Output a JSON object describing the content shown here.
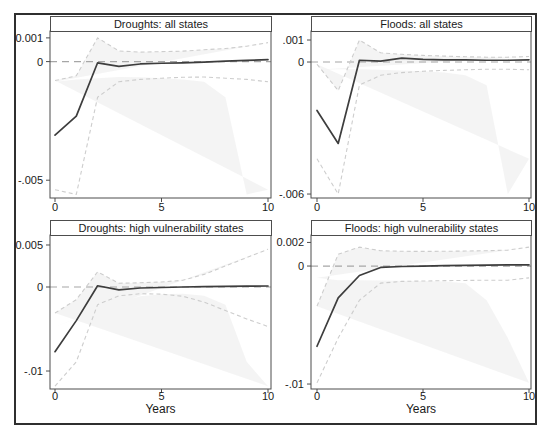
{
  "figure": {
    "background": "#ffffff",
    "border_color": "#2f2f2f"
  },
  "colors": {
    "main_line": "#3d3d3d",
    "ci_line": "#cdcdcd",
    "ci_fill": "rgba(205,205,205,0.22)",
    "zero_line": "#a6a6a6",
    "axis": "#4d4d4d",
    "text": "#1a1a1a"
  },
  "chart_data": [
    {
      "type": "line",
      "title": "Droughts: all states",
      "xlabel": "",
      "x": [
        0,
        1,
        2,
        3,
        4,
        5,
        6,
        7,
        8,
        9,
        10
      ],
      "xlim": [
        0,
        10
      ],
      "ylim": [
        -0.00575,
        0.00129
      ],
      "xticks": {
        "values": [
          0,
          5,
          10
        ],
        "labels": [
          "0",
          "5",
          "10"
        ]
      },
      "yticks": {
        "values": [
          0.001,
          0,
          -0.005
        ],
        "labels": [
          "0.001",
          "0",
          "-.005"
        ]
      },
      "zero_line": true,
      "grid": false,
      "legend": "none",
      "series": [
        {
          "name": "point-estimate",
          "values": [
            -0.0031,
            -0.0023,
            -5e-05,
            -0.0002,
            -0.0001,
            -7e-05,
            -5e-05,
            -2e-05,
            2e-05,
            5e-05,
            8e-05
          ]
        },
        {
          "name": "ci-upper",
          "values": [
            -0.0008,
            -0.0006,
            0.001,
            0.00045,
            0.0004,
            0.00042,
            0.00044,
            0.0005,
            0.00055,
            0.00065,
            0.0008
          ]
        },
        {
          "name": "ci-lower",
          "values": [
            -0.0054,
            -0.0056,
            -0.0015,
            -0.00085,
            -0.00075,
            -0.0007,
            -0.00066,
            -0.00065,
            -0.0007,
            -0.00075,
            -0.00085
          ]
        }
      ]
    },
    {
      "type": "line",
      "title": "Floods: all states",
      "xlabel": "",
      "x": [
        0,
        1,
        2,
        3,
        4,
        5,
        6,
        7,
        8,
        9,
        10
      ],
      "xlim": [
        0,
        10
      ],
      "ylim": [
        -0.00618,
        0.00141
      ],
      "xticks": {
        "values": [
          0,
          5,
          10
        ],
        "labels": [
          "0",
          "5",
          "10"
        ]
      },
      "yticks": {
        "values": [
          0.001,
          0,
          -0.006
        ],
        "labels": [
          ".001",
          "0",
          "-.006"
        ]
      },
      "zero_line": true,
      "grid": false,
      "legend": "none",
      "series": [
        {
          "name": "point-estimate",
          "values": [
            -0.0022,
            -0.0037,
            8e-05,
            4e-05,
            0.00018,
            0.00012,
            0.0001,
            0.0001,
            8e-05,
            8e-05,
            0.0001
          ]
        },
        {
          "name": "ci-upper",
          "values": [
            -0.0001,
            -0.0013,
            0.001,
            0.00042,
            0.00035,
            0.0003,
            0.00027,
            0.00024,
            0.00022,
            0.00022,
            0.00025
          ]
        },
        {
          "name": "ci-lower",
          "values": [
            -0.0044,
            -0.006,
            -0.00105,
            -0.0006,
            -0.00048,
            -0.00042,
            -0.00038,
            -0.00035,
            -0.00033,
            -0.00033,
            -0.00035
          ]
        }
      ]
    },
    {
      "type": "line",
      "title": "Droughts: high vulnerability states",
      "xlabel": "Years",
      "x": [
        0,
        1,
        2,
        3,
        4,
        5,
        6,
        7,
        8,
        9,
        10
      ],
      "xlim": [
        0,
        10
      ],
      "ylim": [
        -0.01214,
        0.00619
      ],
      "xticks": {
        "values": [
          0,
          5,
          10
        ],
        "labels": [
          "0",
          "5",
          "10"
        ]
      },
      "yticks": {
        "values": [
          0.005,
          0,
          -0.01
        ],
        "labels": [
          "0.005",
          "0",
          "-.01"
        ]
      },
      "zero_line": true,
      "grid": false,
      "legend": "none",
      "series": [
        {
          "name": "point-estimate",
          "values": [
            -0.0077,
            -0.004,
            0.00015,
            -0.00035,
            -0.00012,
            -6e-05,
            0,
            4e-05,
            8e-05,
            0.0001,
            0.00012
          ]
        },
        {
          "name": "ci-upper",
          "values": [
            -0.0031,
            -0.0015,
            0.0018,
            0.00045,
            0.0005,
            0.0006,
            0.0008,
            0.0015,
            0.0025,
            0.0035,
            0.0045
          ]
        },
        {
          "name": "ci-lower",
          "values": [
            -0.0118,
            -0.0089,
            -0.0021,
            -0.00105,
            -0.0008,
            -0.00085,
            -0.0011,
            -0.0018,
            -0.0028,
            -0.0038,
            -0.0047
          ]
        }
      ]
    },
    {
      "type": "line",
      "title": "Floods: high vulnerability states",
      "xlabel": "Years",
      "x": [
        0,
        1,
        2,
        3,
        4,
        5,
        6,
        7,
        8,
        9,
        10
      ],
      "xlim": [
        0,
        10
      ],
      "ylim": [
        -0.01042,
        0.00263
      ],
      "xticks": {
        "values": [
          0,
          5,
          10
        ],
        "labels": [
          "0",
          "5",
          "10"
        ]
      },
      "yticks": {
        "values": [
          0.002,
          0,
          -0.01
        ],
        "labels": [
          "0.002",
          "0",
          "-.01"
        ]
      },
      "zero_line": true,
      "grid": false,
      "legend": "none",
      "series": [
        {
          "name": "point-estimate",
          "values": [
            -0.0068,
            -0.0027,
            -0.0008,
            -0.00012,
            -4e-05,
            0,
            3e-05,
            5e-05,
            7e-05,
            9e-05,
            0.0001
          ]
        },
        {
          "name": "ci-upper",
          "values": [
            -0.0034,
            0.001,
            0.0016,
            0.0013,
            0.00125,
            0.00124,
            0.00125,
            0.00127,
            0.0013,
            0.00135,
            0.0016
          ]
        },
        {
          "name": "ci-lower",
          "values": [
            -0.0099,
            -0.0061,
            -0.0029,
            -0.00145,
            -0.0013,
            -0.00127,
            -0.00124,
            -0.00122,
            -0.0012,
            -0.0012,
            -0.001
          ]
        }
      ]
    }
  ]
}
